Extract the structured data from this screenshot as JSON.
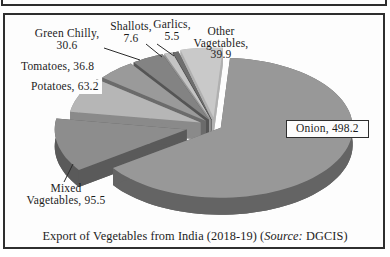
{
  "figure": {
    "frame_color": "#2e2e2e",
    "background_color": "#fdfdfd"
  },
  "chart_data": {
    "type": "pie",
    "style": "3d-exploded-pie",
    "title": "Export of Vegetables from India (2018-19) (Source: DGCIS)",
    "title_parts": {
      "pre": "Export of Vegetables from India (2018-19) (",
      "italic": "Source:",
      "post": " DGCIS)"
    },
    "legend": "none",
    "slices": [
      {
        "name": "Onion",
        "value": 498.2,
        "label_lines": [
          "Onion, 498.2"
        ],
        "color_top": "#989898",
        "color_side": "#646464"
      },
      {
        "name": "Mixed Vagetables",
        "value": 95.5,
        "label_lines": [
          "Mixed",
          "Vagetables, 95.5"
        ],
        "color_top": "#8d8d8d",
        "color_side": "#5a5a5a"
      },
      {
        "name": "Potatoes",
        "value": 63.2,
        "label_lines": [
          "Potatoes, 63.2"
        ],
        "color_top": "#b6b6b6",
        "color_side": "#8a8a8a"
      },
      {
        "name": "Tomatoes",
        "value": 36.8,
        "label_lines": [
          "Tomatoes, 36.8"
        ],
        "color_top": "#9a9a9a",
        "color_side": "#6b6b6b"
      },
      {
        "name": "Green Chilly",
        "value": 30.6,
        "label_lines": [
          "Green Chilly,",
          "30.6"
        ],
        "color_top": "#838383",
        "color_side": "#555555"
      },
      {
        "name": "Shallots",
        "value": 7.6,
        "label_lines": [
          "Shallots,",
          "7.6"
        ],
        "color_top": "#c4c4c4",
        "color_side": "#949494"
      },
      {
        "name": "Garlics",
        "value": 5.5,
        "label_lines": [
          "Garlics,",
          "5.5"
        ],
        "color_top": "#6e6e6e",
        "color_side": "#484848"
      },
      {
        "name": "Other Vagetables",
        "value": 39.9,
        "label_lines": [
          "Other",
          "Vagetables,",
          "39.9"
        ],
        "color_top": "#c9c9c9",
        "color_side": "#b0b0b0"
      }
    ]
  }
}
